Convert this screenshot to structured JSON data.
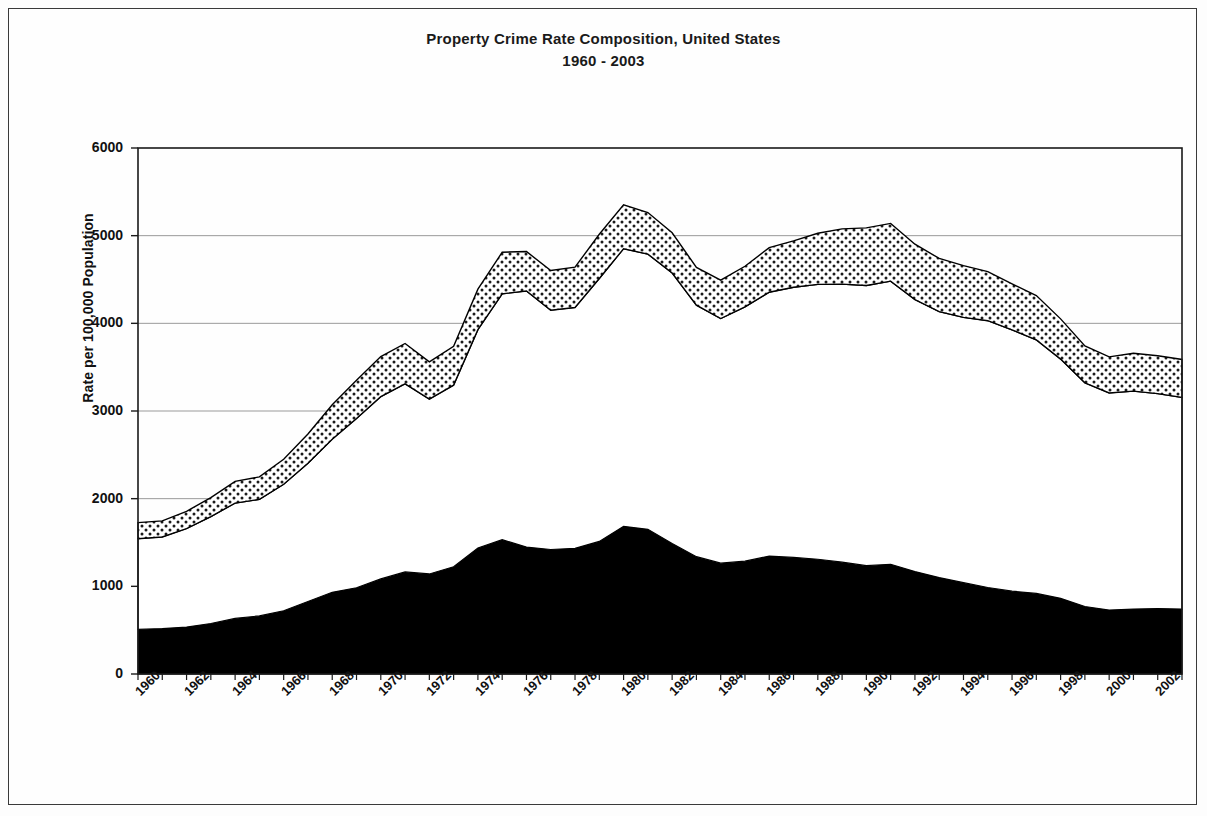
{
  "title": {
    "line1": "Property Crime Rate Composition, United States",
    "line2": "1960 - 2003"
  },
  "axes": {
    "ylabel": "Rate per 100,000 Population",
    "yticks": [
      "0",
      "1000",
      "2000",
      "3000",
      "4000",
      "5000",
      "6000"
    ],
    "xticks": [
      "1960",
      "1962",
      "1964",
      "1966",
      "1968",
      "1970",
      "1972",
      "1974",
      "1976",
      "1978",
      "1980",
      "1982",
      "1984",
      "1986",
      "1988",
      "1990",
      "1992",
      "1994",
      "1996",
      "1998",
      "2000",
      "2002"
    ]
  },
  "colors": {
    "band_bottom": "#000000",
    "band_middle": "#ffffff",
    "band_top_fill": "#e8e8e8",
    "outline": "#000000",
    "gridline": "#9a9a9a",
    "frame": "#3a3a3a"
  },
  "chart_data": {
    "type": "area",
    "title": "Property Crime Rate Composition, United States 1960 - 2003",
    "xlabel": "",
    "ylabel": "Rate per 100,000 Population",
    "ylim": [
      0,
      6000
    ],
    "xlim": [
      1960,
      2003
    ],
    "grid": true,
    "legend_position": "none",
    "stacked": true,
    "x": [
      1960,
      1961,
      1962,
      1963,
      1964,
      1965,
      1966,
      1967,
      1968,
      1969,
      1970,
      1971,
      1972,
      1973,
      1974,
      1975,
      1976,
      1977,
      1978,
      1979,
      1980,
      1981,
      1982,
      1983,
      1984,
      1985,
      1986,
      1987,
      1988,
      1989,
      1990,
      1991,
      1992,
      1993,
      1994,
      1995,
      1996,
      1997,
      1998,
      1999,
      2000,
      2001,
      2002,
      2003
    ],
    "series": [
      {
        "name": "Burglary",
        "values": [
          509,
          518,
          535,
          576,
          634,
          663,
          721,
          827,
          932,
          984,
          1085,
          1164,
          1141,
          1223,
          1438,
          1532,
          1448,
          1420,
          1434,
          1512,
          1684,
          1650,
          1489,
          1338,
          1264,
          1287,
          1345,
          1330,
          1309,
          1276,
          1236,
          1252,
          1168,
          1100,
          1042,
          987,
          945,
          919,
          863,
          770,
          729,
          741,
          747,
          741
        ]
      },
      {
        "name": "Larceny-Theft",
        "values": [
          1035,
          1045,
          1124,
          1219,
          1316,
          1329,
          1443,
          1576,
          1747,
          1931,
          2079,
          2146,
          1994,
          2072,
          2490,
          2805,
          2921,
          2730,
          2747,
          2999,
          3167,
          3140,
          3085,
          2869,
          2791,
          2901,
          3010,
          3081,
          3135,
          3171,
          3195,
          3229,
          3103,
          3034,
          3026,
          3043,
          2980,
          2892,
          2729,
          2551,
          2477,
          2486,
          2451,
          2414
        ]
      },
      {
        "name": "Motor Vehicle Theft",
        "values": [
          183,
          184,
          197,
          216,
          247,
          257,
          286,
          334,
          393,
          436,
          457,
          460,
          426,
          443,
          462,
          474,
          450,
          452,
          460,
          505,
          502,
          474,
          459,
          431,
          437,
          463,
          508,
          529,
          583,
          630,
          658,
          659,
          632,
          606,
          591,
          560,
          526,
          506,
          459,
          422,
          412,
          431,
          432,
          433
        ]
      }
    ],
    "totals": [
      1727,
      1747,
      1856,
      2011,
      2197,
      2249,
      2450,
      2737,
      3072,
      3351,
      3621,
      3770,
      3561,
      3738,
      4390,
      4811,
      4819,
      4602,
      4641,
      5016,
      5353,
      5264,
      5033,
      4638,
      4492,
      4651,
      4863,
      4940,
      5027,
      5077,
      5089,
      5140,
      4903,
      4740,
      4659,
      4590,
      4451,
      4317,
      4051,
      3743,
      3618,
      3658,
      3630,
      3588
    ]
  }
}
